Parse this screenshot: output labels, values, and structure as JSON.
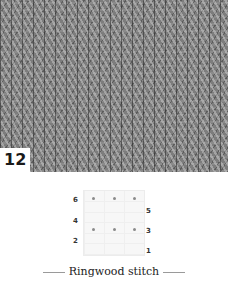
{
  "photo": {
    "description": "knitted swatch photo, gray yarn, vertical ribbed texture",
    "number_label": "12"
  },
  "chart": {
    "type": "knitting-chart",
    "columns": 3,
    "row_numbers_left": [
      "6",
      "4",
      "2"
    ],
    "row_numbers_right": [
      "5",
      "3",
      "1"
    ],
    "dot_rows": [
      {
        "row": "6",
        "dots": 3
      },
      {
        "row": "3",
        "dots": 3
      }
    ],
    "colors": {
      "dot": "#8a8a8a",
      "grid_bg": "#f7f7f7",
      "grid_line": "#efefef"
    }
  },
  "caption": {
    "title": "Ringwood stitch"
  }
}
